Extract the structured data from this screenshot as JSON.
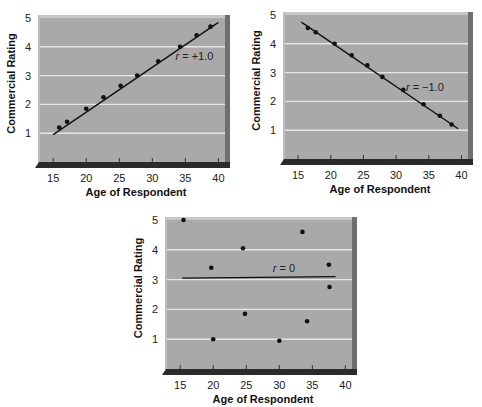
{
  "colors": {
    "panel": "#a9a9a9",
    "panel_top_bevel": "#c8c8c8",
    "panel_right_bevel": "#6f6f6f",
    "floor": "#2a2a2a",
    "gridline": "#e6e6e6",
    "line": "#111111",
    "point": "#111111"
  },
  "chart_data": [
    {
      "id": "positive",
      "type": "scatter",
      "title": "",
      "xlabel": "Age of Respondent",
      "ylabel": "Commercial Rating",
      "xlim": [
        13,
        41
      ],
      "ylim": [
        0,
        5
      ],
      "xticks": [
        15,
        20,
        25,
        30,
        35,
        40
      ],
      "yticks": [
        1,
        2,
        3,
        4,
        5
      ],
      "grid": "horizontal",
      "annotation": "r = +1.0",
      "annotation_pos": [
        33.5,
        3.55
      ],
      "fit_line": {
        "x": [
          15,
          40
        ],
        "y": [
          0.95,
          4.85
        ]
      },
      "points": [
        {
          "x": 15.9,
          "y": 1.2
        },
        {
          "x": 17.1,
          "y": 1.4
        },
        {
          "x": 20.0,
          "y": 1.85
        },
        {
          "x": 22.6,
          "y": 2.25
        },
        {
          "x": 25.2,
          "y": 2.65
        },
        {
          "x": 27.7,
          "y": 3.0
        },
        {
          "x": 30.9,
          "y": 3.5
        },
        {
          "x": 34.2,
          "y": 4.0
        },
        {
          "x": 36.7,
          "y": 4.4
        },
        {
          "x": 38.8,
          "y": 4.7
        }
      ]
    },
    {
      "id": "negative",
      "type": "scatter",
      "title": "",
      "xlabel": "Age of Respondent",
      "ylabel": "Commercial Rating",
      "xlim": [
        13,
        41
      ],
      "ylim": [
        0,
        5
      ],
      "xticks": [
        15,
        20,
        25,
        30,
        35,
        40
      ],
      "yticks": [
        1,
        2,
        3,
        4,
        5
      ],
      "grid": "horizontal",
      "annotation": "r = −1.0",
      "annotation_pos": [
        31.5,
        2.35
      ],
      "fit_line": {
        "x": [
          15.5,
          39.5
        ],
        "y": [
          4.75,
          1.05
        ]
      },
      "points": [
        {
          "x": 16.5,
          "y": 4.55
        },
        {
          "x": 17.7,
          "y": 4.4
        },
        {
          "x": 20.6,
          "y": 4.0
        },
        {
          "x": 23.2,
          "y": 3.6
        },
        {
          "x": 25.6,
          "y": 3.25
        },
        {
          "x": 27.9,
          "y": 2.85
        },
        {
          "x": 31.1,
          "y": 2.4
        },
        {
          "x": 34.2,
          "y": 1.9
        },
        {
          "x": 36.7,
          "y": 1.5
        },
        {
          "x": 38.5,
          "y": 1.2
        }
      ]
    },
    {
      "id": "zero",
      "type": "scatter",
      "title": "",
      "xlabel": "Age of Respondent",
      "ylabel": "Commercial Rating",
      "xlim": [
        13,
        41
      ],
      "ylim": [
        0,
        5
      ],
      "xticks": [
        15,
        20,
        25,
        30,
        35,
        40
      ],
      "yticks": [
        1,
        2,
        3,
        4,
        5
      ],
      "grid": "horizontal",
      "annotation": "r = 0",
      "annotation_pos": [
        29.0,
        3.25
      ],
      "fit_line": {
        "x": [
          15.3,
          38.5
        ],
        "y": [
          3.05,
          3.1
        ]
      },
      "points": [
        {
          "x": 15.5,
          "y": 5.0
        },
        {
          "x": 33.5,
          "y": 4.6
        },
        {
          "x": 24.5,
          "y": 4.05
        },
        {
          "x": 19.7,
          "y": 3.4
        },
        {
          "x": 37.5,
          "y": 3.5
        },
        {
          "x": 37.6,
          "y": 2.75
        },
        {
          "x": 24.8,
          "y": 1.85
        },
        {
          "x": 34.2,
          "y": 1.6
        },
        {
          "x": 20.0,
          "y": 1.0
        },
        {
          "x": 30.0,
          "y": 0.95
        }
      ]
    }
  ],
  "layout": [
    {
      "left": 0,
      "top": 0,
      "plot": {
        "x": 38,
        "y": 15,
        "w": 192,
        "h": 153
      }
    },
    {
      "left": 0,
      "top": 0,
      "plot": {
        "x": 283,
        "y": 12,
        "w": 190,
        "h": 153
      }
    },
    {
      "left": 0,
      "top": 0,
      "plot": {
        "x": 165,
        "y": 217,
        "w": 192,
        "h": 158
      }
    }
  ]
}
